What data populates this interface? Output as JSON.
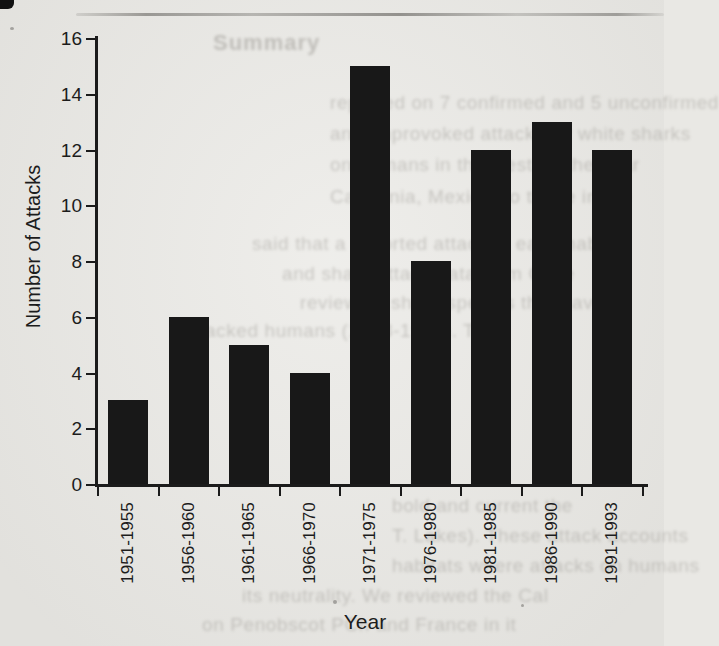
{
  "chart_data": {
    "type": "bar",
    "categories": [
      "1951-1955",
      "1956-1960",
      "1961-1965",
      "1966-1970",
      "1971-1975",
      "1976-1980",
      "1981-1985",
      "1986-1990",
      "1991-1993"
    ],
    "values": [
      3,
      6,
      5,
      4,
      15,
      8,
      12,
      13,
      12
    ],
    "xlabel": "Year",
    "ylabel": "Number of Attacks",
    "ylim": [
      0,
      16
    ],
    "yticks": [
      0,
      2,
      4,
      6,
      8,
      10,
      12,
      14,
      16
    ],
    "grid": false,
    "legend": false,
    "bar_color": "#181818",
    "axis_color": "#1b1b1b",
    "category_label_rotation": -90
  },
  "page": {
    "paper_color": "#e9e8e4",
    "scan_artifacts": {
      "corner_smudge": true,
      "top_streak": true,
      "specks": [
        {
          "x": 10,
          "y": 27,
          "w": 4,
          "h": 3
        },
        {
          "x": 333,
          "y": 600,
          "w": 4,
          "h": 4
        },
        {
          "x": 521,
          "y": 604,
          "w": 3,
          "h": 3
        }
      ]
    }
  },
  "bleed_through_text": {
    "heading": {
      "x": 213,
      "y": 30,
      "text": "Summary"
    },
    "lines": [
      {
        "x": 330,
        "y": 92,
        "text": "reported on 7 confirmed and 5 unconfirmed"
      },
      {
        "x": 330,
        "y": 123,
        "text": "and unprovoked attacks by white sharks"
      },
      {
        "x": 330,
        "y": 154,
        "text": "on humans in the west, in the year"
      },
      {
        "x": 330,
        "y": 186,
        "text": "California, Mexico, to those in the"
      },
      {
        "x": 252,
        "y": 233,
        "text": "said that a reported attack in each habitat"
      },
      {
        "x": 282,
        "y": 263,
        "text": "and shark attack data from Chile"
      },
      {
        "x": 300,
        "y": 292,
        "text": "review all shark species that have"
      },
      {
        "x": 182,
        "y": 320,
        "text": "attacked humans (1988-1994). The"
      },
      {
        "x": 392,
        "y": 495,
        "text": "bold and current the"
      },
      {
        "x": 392,
        "y": 525,
        "text": "T. Lakes). These attack accounts"
      },
      {
        "x": 392,
        "y": 555,
        "text": "habitats where attacks on humans"
      },
      {
        "x": 242,
        "y": 585,
        "text": "its neutrality. We reviewed the Cal"
      },
      {
        "x": 202,
        "y": 614,
        "text": "on Penobscot PCh and France in it"
      }
    ]
  }
}
